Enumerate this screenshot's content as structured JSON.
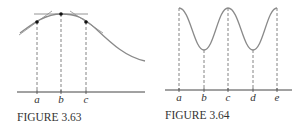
{
  "figures": [
    {
      "caption": "FIGURE 3.63",
      "labels": [
        "a",
        "b",
        "c"
      ]
    },
    {
      "caption": "FIGURE 3.64",
      "labels": [
        "a",
        "b",
        "c",
        "d",
        "e"
      ]
    }
  ],
  "colors": {
    "curve": "#8a8a8a",
    "axis": "#444444",
    "dashed": "#777777",
    "dot": "#111111",
    "tangent": "#888888"
  }
}
